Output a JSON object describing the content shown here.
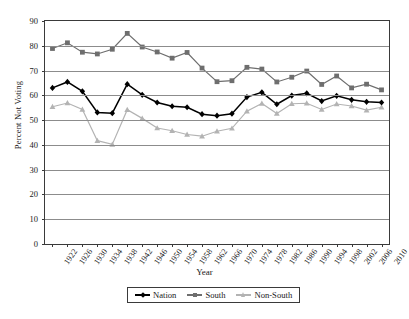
{
  "chart_data": {
    "type": "line",
    "title": "",
    "xlabel": "Year",
    "ylabel": "Percent Not Voting",
    "ylim": [
      0,
      90
    ],
    "ytick_step": 10,
    "yticks": [
      0,
      10,
      20,
      30,
      40,
      50,
      60,
      70,
      80,
      90
    ],
    "grid": true,
    "legend_position": "bottom",
    "categories": [
      1922,
      1926,
      1930,
      1934,
      1938,
      1942,
      1946,
      1950,
      1954,
      1958,
      1962,
      1966,
      1970,
      1974,
      1978,
      1982,
      1986,
      1990,
      1994,
      1998,
      2002,
      2006,
      2010
    ],
    "x": [
      "1922",
      "1926",
      "1930",
      "1934",
      "1938",
      "1942",
      "1946",
      "1950",
      "1954",
      "1958",
      "1962",
      "1966",
      "1970",
      "1974",
      "1978",
      "1982",
      "1986",
      "1990",
      "1994",
      "1998",
      "2002",
      "2006",
      "2010"
    ],
    "series": [
      {
        "name": "Nation",
        "color": "#000000",
        "marker": "diamond",
        "values": [
          63.0,
          65.4,
          61.6,
          53.1,
          52.8,
          64.5,
          60.2,
          57.1,
          55.6,
          55.2,
          52.4,
          51.8,
          52.6,
          59.3,
          61.2,
          56.4,
          59.9,
          60.8,
          57.7,
          59.8,
          58.2,
          57.4,
          57.1
        ]
      },
      {
        "name": "South",
        "color": "#6e6e6e",
        "marker": "square",
        "values": [
          78.9,
          81.2,
          77.4,
          76.7,
          78.6,
          85.0,
          79.5,
          77.5,
          75.0,
          77.3,
          71.0,
          65.5,
          65.9,
          71.3,
          70.6,
          65.4,
          67.3,
          69.8,
          64.4,
          67.8,
          63.0,
          64.5,
          62.2
        ]
      },
      {
        "name": "Non-South",
        "color": "#b3b3b3",
        "marker": "triangle",
        "values": [
          55.4,
          56.9,
          54.3,
          41.7,
          40.2,
          54.2,
          50.7,
          46.8,
          45.7,
          44.2,
          43.5,
          45.5,
          46.7,
          53.6,
          56.7,
          52.7,
          56.6,
          56.8,
          54.3,
          56.5,
          55.7,
          54.0,
          55.2
        ]
      }
    ]
  },
  "legend": {
    "items": [
      {
        "label": "Nation"
      },
      {
        "label": "South"
      },
      {
        "label": "Non-South"
      }
    ]
  },
  "colors": {
    "nation": "#000000",
    "south": "#6e6e6e",
    "non_south": "#b3b3b3",
    "axis": "#3a3a3a",
    "grid": "#8c8c8c",
    "background": "#ffffff"
  }
}
